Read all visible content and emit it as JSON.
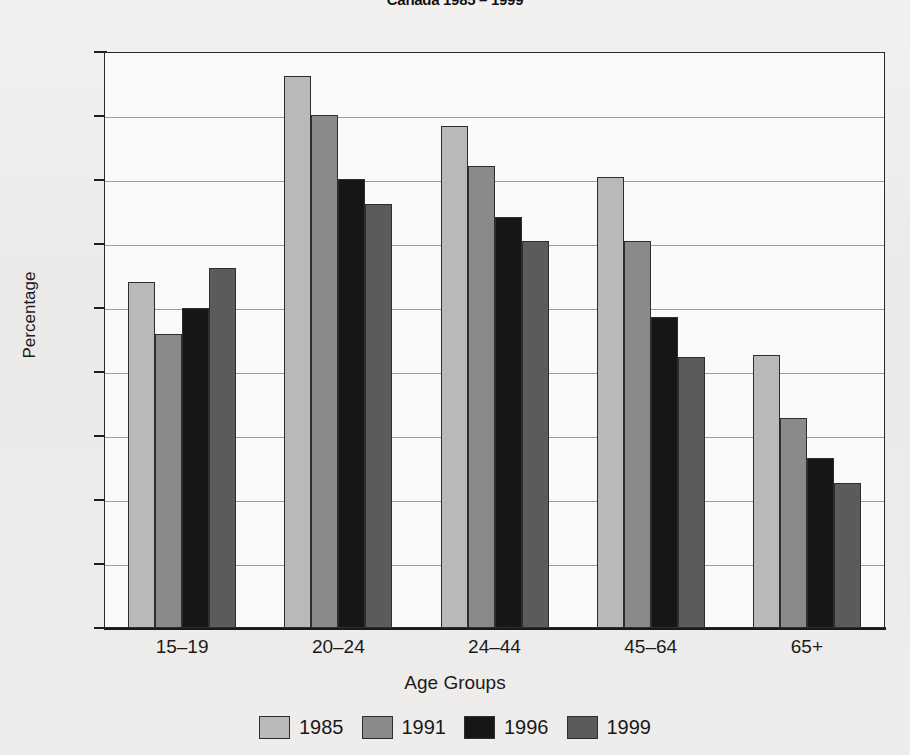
{
  "chart_data": {
    "type": "bar",
    "title": "Canada 1985 – 1999",
    "xlabel": "Age Groups",
    "ylabel": "Percentage",
    "ylim": [
      0,
      45
    ],
    "ytick_step": 5,
    "yticks": [
      45,
      40,
      35,
      30,
      25,
      20,
      15,
      10,
      5,
      0
    ],
    "grid": true,
    "legend_position": "bottom",
    "categories": [
      "15–19",
      "20–24",
      "24–44",
      "45–64",
      "65+"
    ],
    "series": [
      {
        "name": "1985",
        "color": "#b9b9b9",
        "values": [
          27.0,
          43.1,
          39.2,
          35.2,
          21.3
        ]
      },
      {
        "name": "1991",
        "color": "#8a8a8a",
        "values": [
          23.0,
          40.1,
          36.1,
          30.2,
          16.4
        ]
      },
      {
        "name": "1996",
        "color": "#161616",
        "values": [
          25.0,
          35.1,
          32.1,
          24.3,
          13.3
        ]
      },
      {
        "name": "1999",
        "color": "#5b5b5b",
        "values": [
          28.1,
          33.1,
          30.2,
          21.2,
          11.3
        ]
      }
    ]
  }
}
